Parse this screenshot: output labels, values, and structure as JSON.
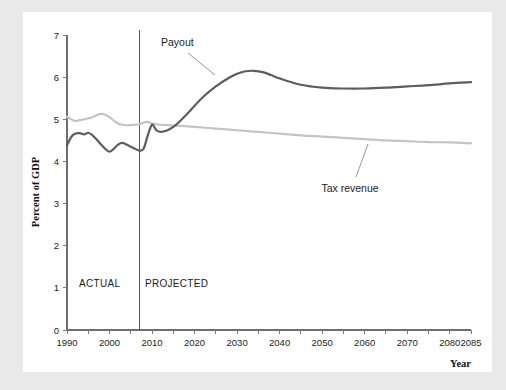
{
  "chart_data": {
    "type": "line",
    "title": "",
    "subtitle": "",
    "xlabel": "Year",
    "ylabel": "Percent of GDP",
    "xlim": [
      1990,
      2085
    ],
    "ylim": [
      0,
      7
    ],
    "grid": false,
    "legend_position": "inline-annotations",
    "x_ticks": [
      1990,
      1995,
      2000,
      2005,
      2010,
      2015,
      2020,
      2025,
      2030,
      2035,
      2040,
      2045,
      2050,
      2055,
      2060,
      2065,
      2070,
      2075,
      2080,
      2085
    ],
    "x_tick_labels": [
      "1990",
      "",
      "2000",
      "",
      "2010",
      "",
      "2020",
      "",
      "2030",
      "",
      "2040",
      "",
      "2050",
      "",
      "2060",
      "",
      "2070",
      "",
      "2080",
      "2085"
    ],
    "y_ticks": [
      0,
      1,
      2,
      3,
      4,
      5,
      6,
      7
    ],
    "y_tick_labels": [
      "0",
      "1",
      "2",
      "3",
      "4",
      "5",
      "6",
      "7"
    ],
    "annotations": [
      {
        "text": "Payout",
        "x": 2015,
        "y": 6.72
      },
      {
        "text": "Tax revenue",
        "x": 2057,
        "y": 3.55
      },
      {
        "text": "ACTUAL",
        "x": 1996,
        "y": 1.12
      },
      {
        "text": "PROJECTED",
        "x": 2013,
        "y": 1.12
      }
    ],
    "divider": {
      "x": 2007,
      "label_left": "ACTUAL",
      "label_right": "PROJECTED"
    },
    "colors": {
      "payout": "#5d5d5d",
      "tax_revenue": "#c4c4c4",
      "axis": "#6e6e6e",
      "background": "#ffffff",
      "page_background": "#e9e9e9"
    },
    "series": [
      {
        "name": "Payout",
        "color": "#5d5d5d",
        "x": [
          1990,
          1991,
          1992,
          1993,
          1994,
          1995,
          1996,
          1997,
          1998,
          1999,
          2000,
          2001,
          2002,
          2003,
          2004,
          2005,
          2006,
          2007,
          2008,
          2009,
          2010,
          2011,
          2012,
          2013,
          2014,
          2015,
          2016,
          2018,
          2020,
          2022,
          2025,
          2028,
          2030,
          2032,
          2034,
          2036,
          2038,
          2040,
          2045,
          2050,
          2055,
          2060,
          2065,
          2070,
          2075,
          2080,
          2085
        ],
        "y": [
          4.38,
          4.58,
          4.66,
          4.67,
          4.64,
          4.68,
          4.62,
          4.52,
          4.4,
          4.3,
          4.23,
          4.3,
          4.4,
          4.44,
          4.4,
          4.35,
          4.3,
          4.26,
          4.3,
          4.62,
          4.87,
          4.74,
          4.7,
          4.72,
          4.76,
          4.82,
          4.9,
          5.1,
          5.32,
          5.53,
          5.78,
          5.98,
          6.08,
          6.14,
          6.15,
          6.12,
          6.05,
          5.97,
          5.82,
          5.75,
          5.73,
          5.73,
          5.75,
          5.78,
          5.81,
          5.85,
          5.88
        ]
      },
      {
        "name": "Tax revenue",
        "color": "#c4c4c4",
        "x": [
          1990,
          1991,
          1992,
          1993,
          1994,
          1995,
          1996,
          1997,
          1998,
          1999,
          2000,
          2001,
          2002,
          2003,
          2004,
          2005,
          2006,
          2007,
          2008,
          2009,
          2010,
          2012,
          2014,
          2016,
          2020,
          2025,
          2030,
          2035,
          2040,
          2045,
          2050,
          2055,
          2060,
          2065,
          2070,
          2075,
          2080,
          2085
        ],
        "y": [
          5.06,
          5.0,
          4.96,
          4.98,
          5.0,
          5.02,
          5.05,
          5.1,
          5.13,
          5.11,
          5.05,
          4.97,
          4.9,
          4.87,
          4.86,
          4.86,
          4.87,
          4.88,
          4.92,
          4.94,
          4.9,
          4.87,
          4.86,
          4.85,
          4.82,
          4.78,
          4.74,
          4.7,
          4.66,
          4.62,
          4.59,
          4.56,
          4.53,
          4.5,
          4.48,
          4.46,
          4.45,
          4.43
        ]
      }
    ]
  },
  "axis": {
    "y_title": "Percent of GDP",
    "x_title": "Year"
  }
}
